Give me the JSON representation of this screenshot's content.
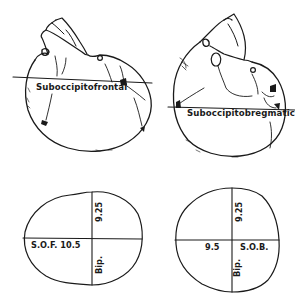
{
  "figure": {
    "top_left": {
      "name": "Skull, flexed (lateral view)",
      "diameter_label": "Suboccipitofrontal"
    },
    "top_right": {
      "name": "Skull, well flexed (lateral view)",
      "diameter_label": "Suboccipitobregmatic"
    },
    "bottom_left": {
      "name": "Presenting cross-section (suboccipitofrontal)",
      "vertical_value": "9.25",
      "vertical_label": "Bip.",
      "horizontal_label": "S.O.F. 10.5"
    },
    "bottom_right": {
      "name": "Presenting cross-section (suboccipitobregmatic)",
      "vertical_value": "9.25",
      "vertical_label": "Bip.",
      "horizontal_value": "9.5",
      "horizontal_label": "S.O.B."
    }
  },
  "colors": {
    "ink": "#1a1a1a",
    "background": "#ffffff"
  }
}
